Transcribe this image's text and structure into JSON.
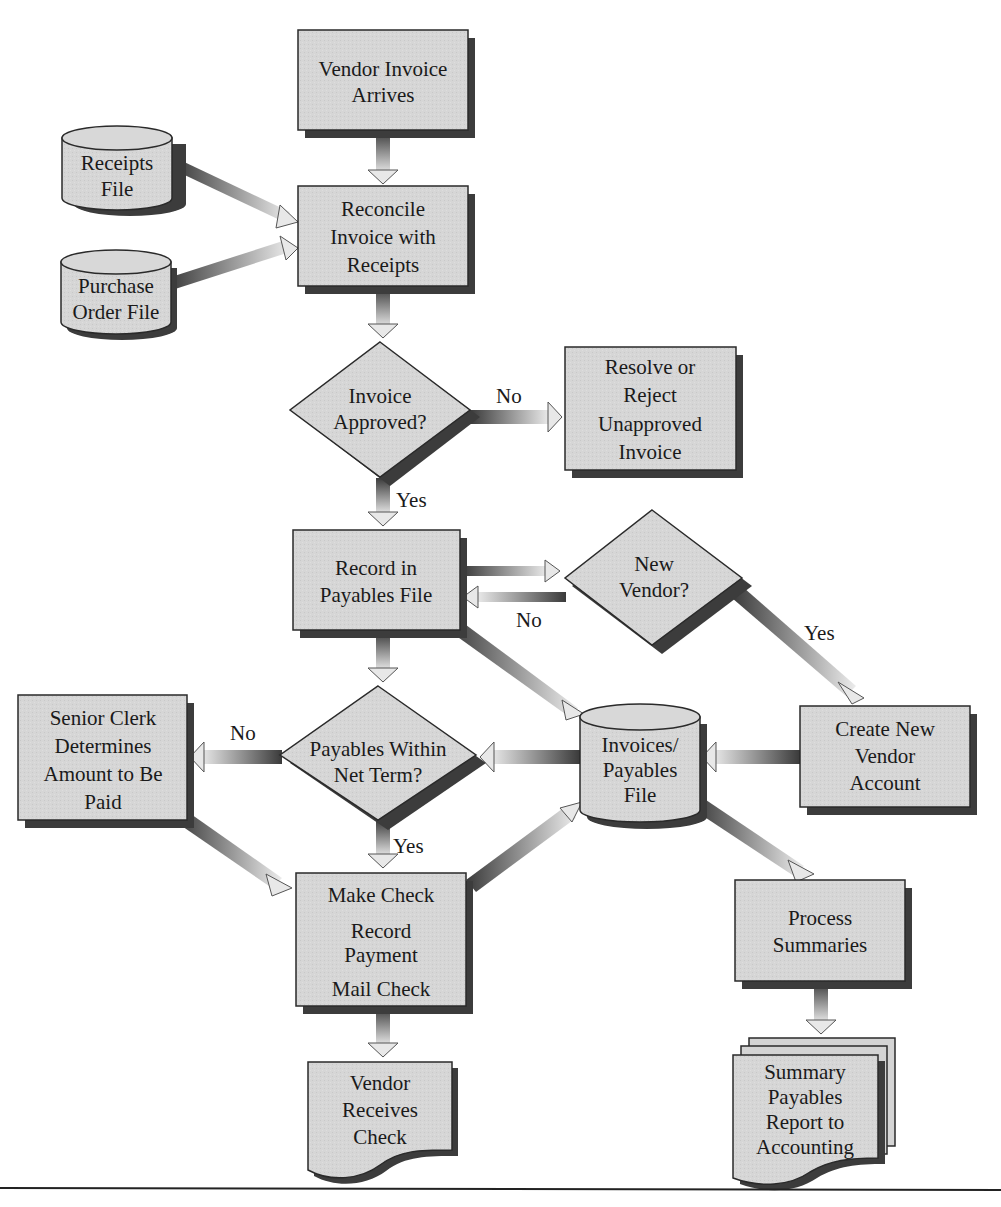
{
  "diagram": {
    "type": "flowchart",
    "title": "",
    "colors": {
      "node_fill": "#d4d4d4",
      "node_stroke": "#2a2a2a",
      "shadow": "#3c3c3c",
      "arrow_dark": "#444444",
      "arrow_light": "#e6e6e6",
      "background": "#ffffff"
    },
    "nodes": {
      "vendor_invoice_arrives": {
        "shape": "process",
        "lines": [
          "Vendor Invoice",
          "Arrives"
        ]
      },
      "receipts_file": {
        "shape": "database",
        "lines": [
          "Receipts",
          "File"
        ]
      },
      "purchase_order_file": {
        "shape": "database",
        "lines": [
          "Purchase",
          "Order File"
        ]
      },
      "reconcile": {
        "shape": "process",
        "lines": [
          "Reconcile",
          "Invoice with",
          "Receipts"
        ]
      },
      "invoice_approved": {
        "shape": "decision",
        "lines": [
          "Invoice",
          "Approved?"
        ]
      },
      "resolve_reject": {
        "shape": "process",
        "lines": [
          "Resolve or",
          "Reject",
          "Unapproved",
          "Invoice"
        ]
      },
      "record_payables": {
        "shape": "process",
        "lines": [
          "Record in",
          "Payables File"
        ]
      },
      "new_vendor": {
        "shape": "decision",
        "lines": [
          "New",
          "Vendor?"
        ]
      },
      "senior_clerk": {
        "shape": "process",
        "lines": [
          "Senior Clerk",
          "Determines",
          "Amount to Be",
          "Paid"
        ]
      },
      "payables_within_net_term": {
        "shape": "decision",
        "lines": [
          "Payables Within",
          "Net Term?"
        ]
      },
      "invoices_payables_file": {
        "shape": "database",
        "lines": [
          "Invoices/",
          "Payables",
          "File"
        ]
      },
      "create_new_vendor": {
        "shape": "process",
        "lines": [
          "Create New",
          "Vendor",
          "Account"
        ]
      },
      "make_check": {
        "shape": "process",
        "lines": [
          "Make Check",
          "Record",
          "Payment",
          "Mail Check"
        ]
      },
      "vendor_receives_check": {
        "shape": "document",
        "lines": [
          "Vendor",
          "Receives",
          "Check"
        ]
      },
      "process_summaries": {
        "shape": "process",
        "lines": [
          "Process",
          "Summaries"
        ]
      },
      "summary_report": {
        "shape": "multi-document",
        "lines": [
          "Summary",
          "Payables",
          "Report to",
          "Accounting"
        ]
      }
    },
    "edges": [
      {
        "from": "vendor_invoice_arrives",
        "to": "reconcile",
        "label": ""
      },
      {
        "from": "receipts_file",
        "to": "reconcile",
        "label": ""
      },
      {
        "from": "purchase_order_file",
        "to": "reconcile",
        "label": ""
      },
      {
        "from": "reconcile",
        "to": "invoice_approved",
        "label": ""
      },
      {
        "from": "invoice_approved",
        "to": "resolve_reject",
        "label": "No"
      },
      {
        "from": "invoice_approved",
        "to": "record_payables",
        "label": "Yes"
      },
      {
        "from": "record_payables",
        "to": "new_vendor",
        "label": ""
      },
      {
        "from": "new_vendor",
        "to": "record_payables",
        "label": "No"
      },
      {
        "from": "new_vendor",
        "to": "create_new_vendor",
        "label": "Yes"
      },
      {
        "from": "record_payables",
        "to": "payables_within_net_term",
        "label": ""
      },
      {
        "from": "record_payables",
        "to": "invoices_payables_file",
        "label": ""
      },
      {
        "from": "create_new_vendor",
        "to": "invoices_payables_file",
        "label": ""
      },
      {
        "from": "invoices_payables_file",
        "to": "payables_within_net_term",
        "label": ""
      },
      {
        "from": "payables_within_net_term",
        "to": "senior_clerk",
        "label": "No"
      },
      {
        "from": "payables_within_net_term",
        "to": "make_check",
        "label": "Yes"
      },
      {
        "from": "senior_clerk",
        "to": "make_check",
        "label": ""
      },
      {
        "from": "make_check",
        "to": "invoices_payables_file",
        "label": ""
      },
      {
        "from": "make_check",
        "to": "vendor_receives_check",
        "label": ""
      },
      {
        "from": "invoices_payables_file",
        "to": "process_summaries",
        "label": ""
      },
      {
        "from": "process_summaries",
        "to": "summary_report",
        "label": ""
      }
    ],
    "edge_labels": {
      "approved_no": "No",
      "approved_yes": "Yes",
      "new_vendor_no": "No",
      "new_vendor_yes": "Yes",
      "net_term_no": "No",
      "net_term_yes": "Yes"
    }
  }
}
